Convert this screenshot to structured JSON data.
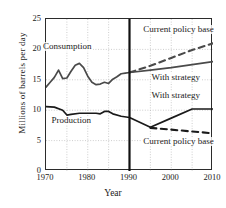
{
  "chart_data": {
    "type": "line",
    "title": "",
    "xlabel": "Year",
    "ylabel": "Millions of barrels per day",
    "xlim": [
      1970,
      2010
    ],
    "ylim": [
      0,
      25
    ],
    "xticks": [
      1970,
      1980,
      1990,
      2000,
      2010
    ],
    "yticks": [
      0,
      5,
      10,
      15,
      20,
      25
    ],
    "xticklabels": [
      "1970",
      "1980",
      "1990",
      "2000",
      "2010"
    ],
    "yticklabels": [
      "0",
      "5",
      "10",
      "15",
      "20",
      "25"
    ],
    "grid": true,
    "grid_style": "dotted",
    "grid_minor_x": [
      1975,
      1985,
      1995,
      2005
    ],
    "legend": "none",
    "divider_year": 1990,
    "series": [
      {
        "name": "Consumption",
        "style": "solid",
        "color": "#4a4a4a",
        "x": [
          1970,
          1971,
          1972,
          1973,
          1974,
          1975,
          1976,
          1977,
          1978,
          1979,
          1980,
          1981,
          1982,
          1983,
          1984,
          1985,
          1986,
          1987,
          1988,
          1989,
          1990
        ],
        "values": [
          13.8,
          14.6,
          15.4,
          16.6,
          15.2,
          15.3,
          16.4,
          17.4,
          17.7,
          17.0,
          15.6,
          14.6,
          14.2,
          14.3,
          14.6,
          14.4,
          15.1,
          15.5,
          16.0,
          16.1,
          16.2
        ]
      },
      {
        "name": "Consumption — With strategy",
        "style": "solid",
        "color": "#4a4a4a",
        "x": [
          1990,
          1995,
          2000,
          2005,
          2010
        ],
        "values": [
          16.2,
          16.6,
          17.0,
          17.5,
          18.0
        ]
      },
      {
        "name": "Consumption — Current policy base",
        "style": "dashed",
        "color": "#4a4a4a",
        "x": [
          1990,
          1995,
          2000,
          2005,
          2010
        ],
        "values": [
          16.2,
          17.3,
          18.6,
          19.9,
          21.0
        ]
      },
      {
        "name": "Production",
        "style": "solid",
        "color": "#1a1a1a",
        "x": [
          1970,
          1972,
          1974,
          1975,
          1976,
          1978,
          1980,
          1982,
          1983,
          1984,
          1985,
          1986,
          1988,
          1990
        ],
        "values": [
          10.6,
          10.5,
          10.0,
          9.2,
          9.3,
          9.5,
          9.5,
          9.5,
          9.4,
          9.8,
          9.8,
          9.4,
          9.0,
          8.8
        ]
      },
      {
        "name": "Production — With strategy",
        "style": "solid",
        "color": "#1a1a1a",
        "x": [
          1990,
          1995,
          2000,
          2005,
          2010
        ],
        "values": [
          8.8,
          7.2,
          8.7,
          10.2,
          10.2
        ]
      },
      {
        "name": "Production — Current policy base",
        "style": "dashed",
        "color": "#1a1a1a",
        "x": [
          1995,
          2000,
          2005,
          2010
        ],
        "values": [
          7.1,
          6.8,
          6.5,
          6.2
        ]
      }
    ],
    "annotations": [
      {
        "id": "consumption",
        "text": "Consumption",
        "x": 1976,
        "y": 20.3
      },
      {
        "id": "production",
        "text": "Production",
        "x": 1978,
        "y": 8.0
      },
      {
        "id": "upper-current-policy-base",
        "text": "Current policy base",
        "x": 2000,
        "y": 23.0
      },
      {
        "id": "upper-with-strategy",
        "text": "With strategy",
        "x": 2002,
        "y": 15.1
      },
      {
        "id": "lower-with-strategy",
        "text": "With strategy",
        "x": 2002,
        "y": 12.2
      },
      {
        "id": "lower-current-policy-base",
        "text": "Current policy base",
        "x": 2000,
        "y": 4.6
      }
    ]
  }
}
